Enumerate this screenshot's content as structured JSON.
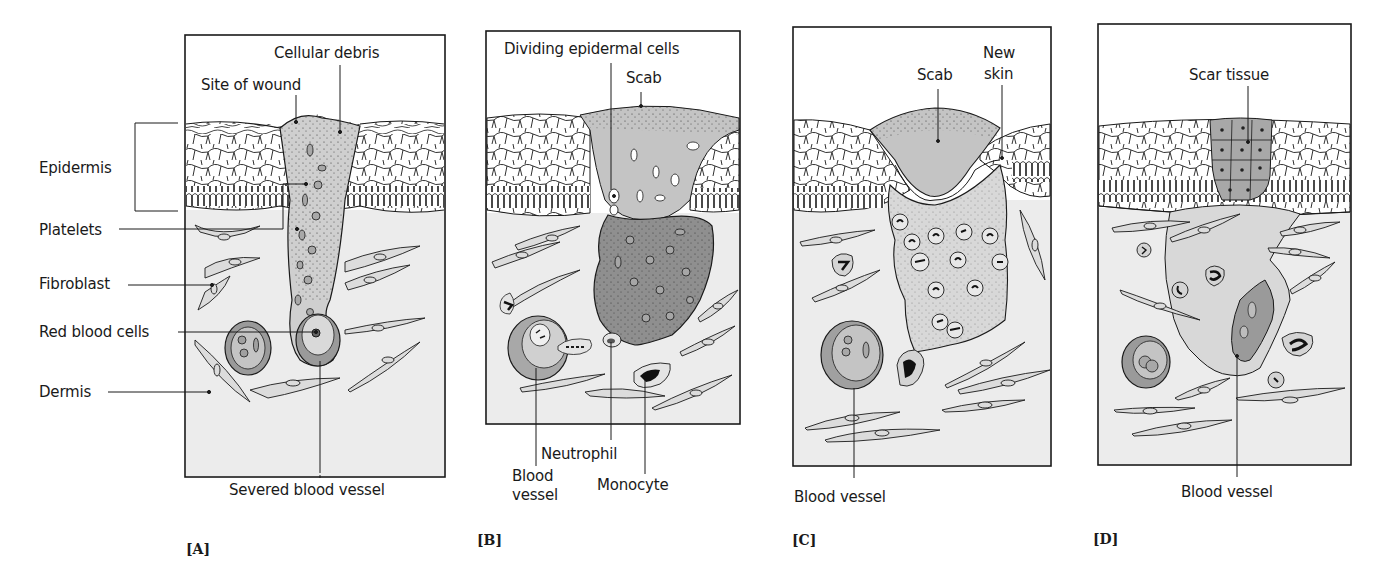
{
  "figure": {
    "colors": {
      "outline": "#1a1a1a",
      "dermis": "#ececec",
      "epidermis": "#ffffff",
      "clot_light": "#c9c9c9",
      "clot_dark": "#8f8f8f",
      "vessel": "#9a9a9a",
      "cell_fill": "#d6d6d6"
    }
  },
  "panels": [
    {
      "id": "A",
      "panel_label": "[A]",
      "labels": {
        "cellular_debris": "Cellular debris",
        "site_of_wound": "Site of wound",
        "epidermis": "Epidermis",
        "platelets": "Platelets",
        "fibroblast": "Fibroblast",
        "red_blood_cells": "Red blood cells",
        "dermis": "Dermis",
        "severed_blood_vessel": "Severed blood vessel"
      }
    },
    {
      "id": "B",
      "panel_label": "[B]",
      "labels": {
        "dividing_epidermal_cells": "Dividing epidermal cells",
        "scab": "Scab",
        "neutrophil": "Neutrophil",
        "blood_vessel_line1": "Blood",
        "blood_vessel_line2": "vessel",
        "monocyte": "Monocyte"
      }
    },
    {
      "id": "C",
      "panel_label": "[C]",
      "labels": {
        "scab": "Scab",
        "new_skin_line1": "New",
        "new_skin_line2": "skin",
        "blood_vessel": "Blood vessel"
      }
    },
    {
      "id": "D",
      "panel_label": "[D]",
      "labels": {
        "scar_tissue": "Scar tissue",
        "blood_vessel": "Blood vessel"
      }
    }
  ]
}
